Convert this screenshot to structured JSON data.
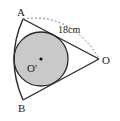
{
  "diagram": {
    "points": {
      "A": {
        "label": "A"
      },
      "B": {
        "label": "B"
      },
      "O": {
        "label": "O"
      },
      "O_prime": {
        "label": "O'"
      }
    },
    "measurements": {
      "radius_label": "18cm"
    },
    "colors": {
      "stroke": "#2a2a2a",
      "circle_fill": "#c8c8c8",
      "dashed_arc": "#555555"
    }
  }
}
